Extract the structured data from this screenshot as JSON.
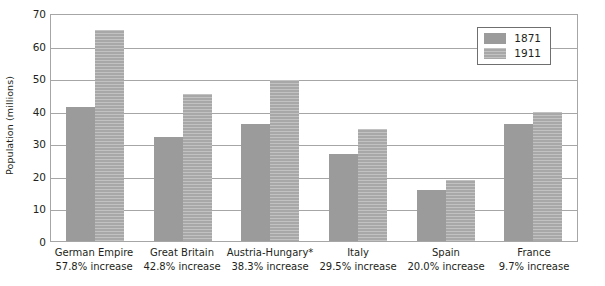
{
  "chart_data": {
    "type": "bar",
    "title": "",
    "xlabel": "",
    "ylabel": "Population (millions)",
    "ylim": [
      0,
      70
    ],
    "ytick_step": 10,
    "yticks": [
      70,
      60,
      50,
      40,
      30,
      20,
      10,
      0
    ],
    "grid": true,
    "legend_position": "top-right-inside",
    "categories": [
      "German Empire",
      "Great Britain",
      "Austria-Hungary*",
      "Italy",
      "Spain",
      "France"
    ],
    "category_sublabels": [
      "57.8% increase",
      "42.8% increase",
      "38.3% increase",
      "29.5% increase",
      "20.0% increase",
      "9.7% increase"
    ],
    "series": [
      {
        "name": "1871",
        "color": "#9b9b9b",
        "values": [
          41.0,
          31.8,
          35.8,
          26.6,
          15.7,
          36.0
        ]
      },
      {
        "name": "1911",
        "color": "#a8a8a8",
        "values": [
          64.7,
          45.2,
          49.5,
          34.5,
          18.8,
          39.5
        ]
      }
    ]
  },
  "legend": {
    "items": [
      {
        "label": "1871",
        "swatch": "s1871"
      },
      {
        "label": "1911",
        "swatch": "s1911"
      }
    ]
  },
  "axes": {
    "y_title": "Population (millions)"
  }
}
